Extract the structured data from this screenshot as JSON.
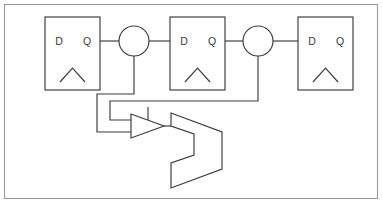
{
  "figure": {
    "kind": "digital-logic-schematic",
    "background_color": "#ffffff",
    "line_color": "#3a3a3a",
    "frame_color": "#9a9a9a",
    "width": 383,
    "height": 204
  },
  "frame": {
    "name": "diagram-border",
    "x": 4,
    "y": 4,
    "width": 374,
    "height": 195
  },
  "flipflops": [
    {
      "id": "ff1",
      "label": "flip-flop-1",
      "d_label": "D",
      "q_label": "Q",
      "x": 45,
      "y": 17,
      "width": 55,
      "height": 73,
      "clock_marker": "clock-triangle"
    },
    {
      "id": "ff2",
      "label": "flip-flop-2",
      "d_label": "D",
      "q_label": "Q",
      "x": 170,
      "y": 17,
      "width": 55,
      "height": 73,
      "clock_marker": "clock-triangle"
    },
    {
      "id": "ff3",
      "label": "flip-flop-3",
      "d_label": "D",
      "q_label": "Q",
      "x": 298,
      "y": 17,
      "width": 55,
      "height": 73,
      "clock_marker": "clock-triangle"
    }
  ],
  "bubbles": [
    {
      "id": "bubble1",
      "label": "inverting-bubble-1",
      "cx": 134,
      "cy": 41,
      "r": 15
    },
    {
      "id": "bubble2",
      "label": "inverting-bubble-2",
      "cx": 258,
      "cy": 41,
      "r": 15
    }
  ],
  "buffer": {
    "id": "buf1",
    "label": "buffer-amplifier",
    "apex_x": 164,
    "top_y": 114,
    "bottom_y": 138,
    "left_x": 131,
    "stub_x": 148,
    "stub_top_y": 107
  },
  "logic_gate": {
    "id": "gate1",
    "label": "logic-gate-body",
    "top_left_x": 171,
    "top_y": 113,
    "right_x": 222,
    "mid_y": 150,
    "bottom_y": 188,
    "notch_x": 194,
    "notch_top_y": 134,
    "notch_bottom_y": 163
  },
  "wires": [
    {
      "id": "w-ff1-q-to-bubble1",
      "label": "q1-to-bubble1"
    },
    {
      "id": "w-bubble1-to-ff2-d",
      "label": "bubble1-to-d2"
    },
    {
      "id": "w-ff2-q-to-bubble2",
      "label": "q2-to-bubble2"
    },
    {
      "id": "w-bubble2-to-ff3-d",
      "label": "bubble2-to-d3"
    },
    {
      "id": "w-bubble1-feedback",
      "label": "bubble1-feedback-to-buffer"
    },
    {
      "id": "w-bubble2-feedback",
      "label": "bubble2-feedback-to-buffer"
    },
    {
      "id": "w-buffer-to-gate",
      "label": "buffer-output-to-gate"
    }
  ]
}
